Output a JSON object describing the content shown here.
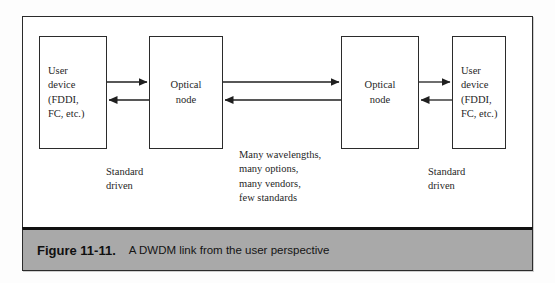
{
  "figure": {
    "caption_number": "Figure 11-11.",
    "caption_text": "A DWDM link from the user perspective"
  },
  "diagram": {
    "nodes": [
      {
        "id": "user-device-left",
        "lines": [
          "User",
          "device",
          "(FDDI,",
          "FC, etc.)"
        ],
        "align": "left"
      },
      {
        "id": "optical-node-left",
        "lines": [
          "Optical",
          "node"
        ],
        "align": "center"
      },
      {
        "id": "optical-node-right",
        "lines": [
          "Optical",
          "node"
        ],
        "align": "center"
      },
      {
        "id": "user-device-right",
        "lines": [
          "User",
          "device",
          "(FDDI,",
          "FC, etc.)"
        ],
        "align": "left"
      }
    ],
    "labels": {
      "standard_driven_left": "Standard\ndriven",
      "center_notes": "Many wavelengths,\nmany options,\nmany vendors,\nfew standards",
      "standard_driven_right": "Standard\ndriven"
    },
    "connections": [
      {
        "id": "user-left-to-onode-left",
        "direction": "right"
      },
      {
        "id": "onode-left-to-user-left",
        "direction": "left"
      },
      {
        "id": "onode-left-to-onode-right",
        "direction": "right"
      },
      {
        "id": "onode-right-to-onode-left",
        "direction": "left"
      },
      {
        "id": "onode-right-to-user-right",
        "direction": "right"
      },
      {
        "id": "user-right-to-onode-right",
        "direction": "left"
      }
    ]
  },
  "colors": {
    "stroke": "#2b2b2b",
    "caption_bar": "#a9a9a9",
    "page_background": "#ffffff"
  }
}
